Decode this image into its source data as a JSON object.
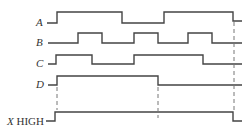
{
  "diagram": {
    "type": "timing-diagram",
    "signals": [
      {
        "name": "A",
        "label": "A",
        "y_low": 23,
        "y_high": 12,
        "points": "47,23 57,23 57,12 122,12 122,23 164,23 164,12 233,12 233,21 242,21"
      },
      {
        "name": "B",
        "label": "B",
        "y_low": 43,
        "y_high": 33,
        "points": "48,43 78,43 78,33 102,33 102,43 134,43 134,33 158,33 158,43 188,43 188,33 212,33 212,43 242,43"
      },
      {
        "name": "C",
        "label": "C",
        "y_low": 64,
        "y_high": 55,
        "points": "48,64 56,64 56,55 92,55 92,64 134,64 134,55 203,55 203,64 242,64"
      },
      {
        "name": "D",
        "label": "D",
        "y_low": 85,
        "y_high": 76,
        "points": "48,85 57,85 57,76 158,76 158,85 242,85"
      },
      {
        "name": "X",
        "label_italic": "X",
        "label_rest": " HIGH",
        "y_low": 121,
        "y_high": 112,
        "points": "46,121 55,121 55,112 233,112 233,121 242,121"
      }
    ],
    "dashed_lines": [
      {
        "x": 57,
        "y1": 87,
        "y2": 110
      },
      {
        "x": 158,
        "y1": 87,
        "y2": 118
      },
      {
        "x": 234,
        "y1": 22,
        "y2": 112
      }
    ]
  }
}
